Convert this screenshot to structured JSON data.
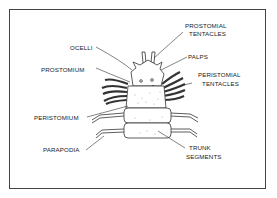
{
  "diagram": {
    "labels": {
      "prostomial_tentacles_1": "PROSTOMIAL",
      "prostomial_tentacles_2": "TENTACLES",
      "ocelli": "OCELLI",
      "palps": "PALPS",
      "prostomium": "PROSTOMIUM",
      "peristomial_tentacles_1": "PERISTOMIAL",
      "peristomial_tentacles_2": "TENTACLES",
      "peristomium": "PERISTOMIUM",
      "parapodia": "PARAPODIA",
      "trunk_segments_1": "TRUNK",
      "trunk_segments_2": "SEGMENTS"
    }
  }
}
